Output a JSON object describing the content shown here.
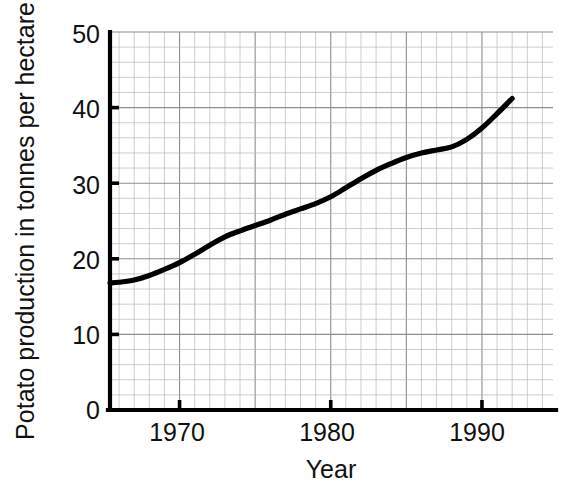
{
  "chart_data": {
    "type": "line",
    "title": "",
    "xlabel": "Year",
    "ylabel": "Potato production in tonnes per hectare",
    "xlim": [
      1965.4,
      1994.7
    ],
    "ylim": [
      0,
      50
    ],
    "grid": true,
    "grid_minor": true,
    "legend": "none",
    "x_ticks": [
      1970,
      1980,
      1990
    ],
    "x_tick_labels": [
      "1970",
      "1980",
      "1990"
    ],
    "x_minor_tick_step": 1,
    "y_ticks": [
      0,
      10,
      20,
      30,
      40,
      50
    ],
    "y_tick_labels": [
      "0",
      "10",
      "20",
      "30",
      "40",
      "50"
    ],
    "y_minor_tick_step": 2,
    "series": [
      {
        "name": "Potato production",
        "color": "#000000",
        "x": [
          1965.4,
          1966,
          1967,
          1968,
          1969,
          1970,
          1971,
          1972,
          1973,
          1974,
          1975,
          1976,
          1977,
          1978,
          1979,
          1980,
          1981,
          1982,
          1983,
          1984,
          1985,
          1986,
          1987,
          1988,
          1989,
          1990,
          1991,
          1992
        ],
        "values": [
          16.8,
          16.9,
          17.2,
          17.8,
          18.6,
          19.5,
          20.6,
          21.8,
          22.9,
          23.7,
          24.4,
          25.1,
          25.9,
          26.6,
          27.3,
          28.2,
          29.4,
          30.6,
          31.7,
          32.6,
          33.4,
          34.0,
          34.4,
          34.8,
          35.8,
          37.3,
          39.2,
          41.2
        ]
      }
    ]
  },
  "axis": {
    "y_label": "Potato production in tonnes per hectare",
    "x_label": "Year",
    "y_tick_0": "0",
    "y_tick_10": "10",
    "y_tick_20": "20",
    "y_tick_30": "30",
    "y_tick_40": "40",
    "y_tick_50": "50",
    "x_tick_1970": "1970",
    "x_tick_1980": "1980",
    "x_tick_1990": "1990"
  }
}
